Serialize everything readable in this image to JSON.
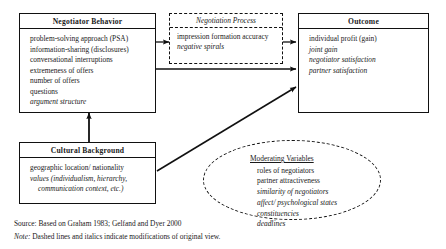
{
  "diagram": {
    "negotiator_behavior": {
      "title": "Negotiator Behavior",
      "items": [
        {
          "text": "problem-solving  approach (PSA)",
          "italic": false
        },
        {
          "text": "information-sharing  (disclosures)",
          "italic": false
        },
        {
          "text": "conversational  interruptions",
          "italic": false
        },
        {
          "text": "extremeness of offers",
          "italic": false
        },
        {
          "text": "number of offers",
          "italic": false
        },
        {
          "text": "questions",
          "italic": false
        },
        {
          "text": "argument structure",
          "italic": true
        }
      ]
    },
    "negotiation_process": {
      "title": "Negotiation  Process",
      "items": [
        {
          "text": "impression  formation accuracy",
          "italic": false
        },
        {
          "text": "negative spirals",
          "italic": true
        }
      ]
    },
    "outcome": {
      "title": "Outcome",
      "items": [
        {
          "text": "individual  profit (gain)",
          "italic": false
        },
        {
          "text": "joint gain",
          "italic": true
        },
        {
          "text": "negotiator  satisfaction",
          "italic": true
        },
        {
          "text": "partner satisfaction",
          "italic": true
        }
      ]
    },
    "cultural_background": {
      "title": "Cultural Background",
      "items": [
        {
          "text": "geographic  location/ nationality",
          "italic": false,
          "indent": false
        },
        {
          "text": "values   (individualism, hierarchy,",
          "italic": true,
          "indent": false
        },
        {
          "text": "communication  context, etc.)",
          "italic": true,
          "indent": true
        }
      ]
    },
    "moderating_variables": {
      "title": "Moderating  Variables",
      "items": [
        {
          "text": "roles of negotiators",
          "italic": false
        },
        {
          "text": "partner attractiveness",
          "italic": false
        },
        {
          "text": "similarity of negotiators",
          "italic": true
        },
        {
          "text": "affect/  psychological states",
          "italic": true
        },
        {
          "text": "constituencies",
          "italic": true
        },
        {
          "text": "deadlines",
          "italic": true
        }
      ]
    }
  },
  "footnotes": {
    "source_label": "Source:",
    "source_text": " Based on Graham 1983; Gelfand and Dyer 2000",
    "note_label": "Note:",
    "note_text": " Dashed lines and italics indicate modifications of original view."
  },
  "colors": {
    "stroke": "#111111",
    "background": "#ffffff",
    "text": "#1a1a1a"
  }
}
